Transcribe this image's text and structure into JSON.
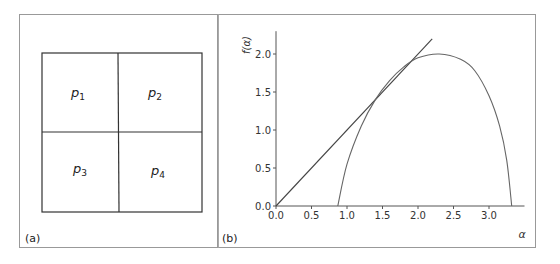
{
  "panel_a": {
    "label": "(a)",
    "cells": [
      "p1",
      "p2",
      "p3",
      "p4"
    ],
    "cell_display": [
      {
        "base": "p",
        "sub": "1"
      },
      {
        "base": "p",
        "sub": "2"
      },
      {
        "base": "p",
        "sub": "3"
      },
      {
        "base": "p",
        "sub": "4"
      }
    ]
  },
  "panel_b": {
    "label": "(b)"
  },
  "chart_data": [
    {
      "type": "diagram",
      "title": "(a)",
      "description": "Square divided into 2x2 grid of cells",
      "cells": [
        [
          "p1",
          "p2"
        ],
        [
          "p3",
          "p4"
        ]
      ]
    },
    {
      "type": "line",
      "title": "(b)",
      "xlabel": "α",
      "ylabel": "f(α)",
      "xlim": [
        0,
        3.5
      ],
      "ylim": [
        0,
        2.3
      ],
      "xticks": [
        "0.0",
        "0.5",
        "1.0",
        "1.5",
        "2.0",
        "2.5",
        "3.0"
      ],
      "yticks": [
        "0.0",
        "0.5",
        "1.0",
        "1.5",
        "2.0"
      ],
      "grid": false,
      "series": [
        {
          "name": "tangent line f=α",
          "x": [
            0.0,
            2.2
          ],
          "y": [
            0.0,
            2.2
          ]
        },
        {
          "name": "f(α) spectrum",
          "x": [
            0.87,
            1.0,
            1.2,
            1.4,
            1.6,
            1.8,
            2.0,
            2.3,
            2.6,
            2.8,
            3.0,
            3.15,
            3.25,
            3.32
          ],
          "y": [
            0.0,
            0.55,
            1.05,
            1.4,
            1.65,
            1.83,
            1.95,
            2.0,
            1.93,
            1.78,
            1.45,
            1.05,
            0.6,
            0.0
          ]
        }
      ]
    }
  ]
}
